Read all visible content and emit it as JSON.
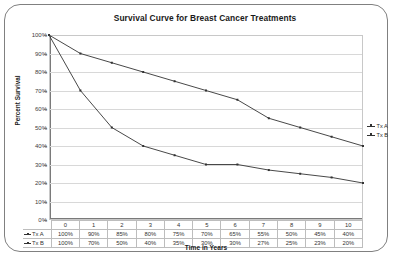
{
  "chart_data": {
    "type": "line",
    "title": "Survival Curve for Breast Cancer Treatments",
    "xlabel": "Time in Years",
    "ylabel": "Percent Survival",
    "categories": [
      "0",
      "1",
      "2",
      "3",
      "4",
      "5",
      "6",
      "7",
      "8",
      "9",
      "10"
    ],
    "x": [
      0,
      1,
      2,
      3,
      4,
      5,
      6,
      7,
      8,
      9,
      10
    ],
    "series": [
      {
        "name": "Tx A",
        "values": [
          100,
          90,
          85,
          80,
          75,
          70,
          65,
          55,
          50,
          45,
          40
        ],
        "labels": [
          "100%",
          "90%",
          "85%",
          "80%",
          "75%",
          "70%",
          "65%",
          "55%",
          "50%",
          "45%",
          "40%"
        ],
        "color": "#333333"
      },
      {
        "name": "Tx B",
        "values": [
          100,
          70,
          50,
          40,
          35,
          30,
          30,
          27,
          25,
          23,
          20
        ],
        "labels": [
          "100%",
          "70%",
          "50%",
          "40%",
          "35%",
          "30%",
          "30%",
          "27%",
          "25%",
          "23%",
          "20%"
        ],
        "color": "#333333"
      }
    ],
    "ylim": [
      0,
      100
    ],
    "xlim": [
      0,
      10
    ],
    "ytick_labels": [
      "100%",
      "90%",
      "80%",
      "70%",
      "60%",
      "50%",
      "40%",
      "30%",
      "20%",
      "10%",
      "0%"
    ],
    "ytick_values": [
      100,
      90,
      80,
      70,
      60,
      50,
      40,
      30,
      20,
      10,
      0
    ],
    "grid": true,
    "legend_position": "right",
    "legend_entries": [
      "Tx A",
      "Tx B"
    ],
    "data_table": {
      "visible": true,
      "column_headers": [
        "0",
        "1",
        "2",
        "3",
        "4",
        "5",
        "6",
        "7",
        "8",
        "9",
        "10"
      ],
      "rows": [
        {
          "label": "Tx A",
          "cells": [
            "100%",
            "90%",
            "85%",
            "80%",
            "75%",
            "70%",
            "65%",
            "55%",
            "50%",
            "45%",
            "40%"
          ]
        },
        {
          "label": "Tx B",
          "cells": [
            "100%",
            "70%",
            "50%",
            "40%",
            "35%",
            "30%",
            "30%",
            "27%",
            "25%",
            "23%",
            "20%"
          ]
        }
      ]
    }
  }
}
